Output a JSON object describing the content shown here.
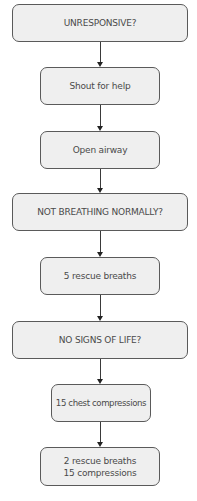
{
  "flowchart": {
    "title": "",
    "colors": {
      "box_fill": "#efefef",
      "box_border": "#5a5a5a",
      "text": "#4a4a4a",
      "arrow": "#333333"
    },
    "nodes": [
      {
        "id": "unresponsive",
        "type": "decision",
        "label": "UNRESPONSIVE?"
      },
      {
        "id": "shout",
        "type": "action",
        "label": "Shout for help"
      },
      {
        "id": "airway",
        "type": "action",
        "label": "Open airway"
      },
      {
        "id": "not-breathing",
        "type": "decision",
        "label": "NOT BREATHING NORMALLY?"
      },
      {
        "id": "rescue-breaths",
        "type": "action",
        "label": "5 rescue breaths"
      },
      {
        "id": "no-signs",
        "type": "decision",
        "label": "NO SIGNS OF LIFE?"
      },
      {
        "id": "chest-compressions",
        "type": "action",
        "label": "15 chest compressions"
      },
      {
        "id": "cycle",
        "type": "action",
        "label_line1": "2 rescue breaths",
        "label_line2": "15 compressions"
      }
    ],
    "edges": [
      [
        "unresponsive",
        "shout"
      ],
      [
        "shout",
        "airway"
      ],
      [
        "airway",
        "not-breathing"
      ],
      [
        "not-breathing",
        "rescue-breaths"
      ],
      [
        "rescue-breaths",
        "no-signs"
      ],
      [
        "no-signs",
        "chest-compressions"
      ],
      [
        "chest-compressions",
        "cycle"
      ]
    ]
  }
}
